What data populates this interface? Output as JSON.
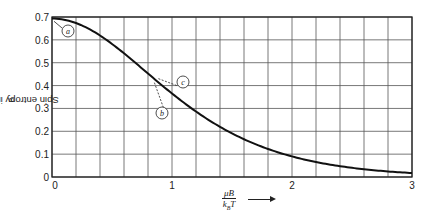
{
  "chart_data": {
    "type": "line",
    "title": "",
    "xlabel": "μB / k_B T",
    "ylabel": "Spin entropy in units Nk_B",
    "xlim": [
      0,
      3
    ],
    "ylim": [
      0,
      0.7
    ],
    "grid": true,
    "x_ticks": [
      "0",
      "1",
      "2",
      "3"
    ],
    "y_ticks": [
      "0",
      "0.1",
      "0.2",
      "0.3",
      "0.4",
      "0.5",
      "0.6",
      "0.7"
    ],
    "series": [
      {
        "name": "Spin entropy",
        "x": [
          0,
          0.2,
          0.4,
          0.6,
          0.8,
          1.0,
          1.2,
          1.4,
          1.6,
          1.8,
          2.0,
          2.2,
          2.4,
          2.6,
          2.8,
          3.0
        ],
        "values": [
          0.693,
          0.673,
          0.617,
          0.532,
          0.435,
          0.334,
          0.25,
          0.18,
          0.126,
          0.087,
          0.059,
          0.04,
          0.027,
          0.018,
          0.012,
          0.008
        ]
      }
    ],
    "annotations": [
      {
        "label": "a",
        "x": 0.0,
        "y": 0.693
      },
      {
        "label": "b",
        "x": 0.87,
        "y": 0.4
      },
      {
        "label": "c",
        "x": 0.87,
        "y": 0.4
      }
    ]
  },
  "labels": {
    "y_axis": "Spin entropy in units Nk",
    "y_axis_sub": "B",
    "x_num": "μB",
    "x_den": "k",
    "x_den_sub": "B",
    "x_den_tail": "T",
    "origin_x": "0"
  }
}
